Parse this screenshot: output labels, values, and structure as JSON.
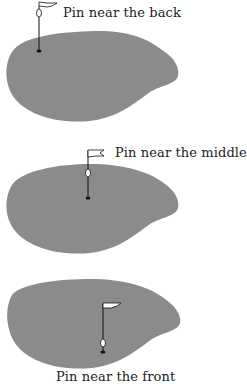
{
  "diagram": {
    "panels": [
      {
        "id": "back",
        "label": "Pin near the back",
        "pin_position": "back"
      },
      {
        "id": "middle",
        "label": "Pin near the middle",
        "pin_position": "middle"
      },
      {
        "id": "front",
        "label": "Pin near the front",
        "pin_position": "front"
      }
    ],
    "colors": {
      "green": "#8b8b8b",
      "pin": "#111111",
      "flag": "#ffffff",
      "text": "#222222"
    }
  }
}
